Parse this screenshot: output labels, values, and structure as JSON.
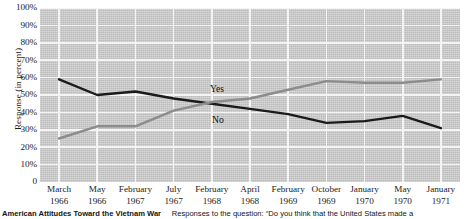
{
  "chart_data": {
    "type": "line",
    "title": "American Attitudes Toward the Vietnam War",
    "xlabel": "",
    "ylabel": "Response (in percent)",
    "ylim": [
      0,
      100
    ],
    "grid": true,
    "legend": "inline-labels",
    "categories": [
      "March 1966",
      "May 1966",
      "February 1967",
      "July 1967",
      "February 1968",
      "April 1968",
      "February 1969",
      "October 1969",
      "January 1970",
      "May 1970",
      "January 1971"
    ],
    "category_months": [
      "March",
      "May",
      "February",
      "July",
      "February",
      "April",
      "February",
      "October",
      "January",
      "May",
      "January"
    ],
    "category_years": [
      "1966",
      "1966",
      "1967",
      "1967",
      "1968",
      "1968",
      "1969",
      "1969",
      "1970",
      "1970",
      "1971"
    ],
    "ytick_labels": [
      "100%",
      "90%",
      "80%",
      "70%",
      "60%",
      "50%",
      "40%",
      "30%",
      "20%",
      "10%",
      "0"
    ],
    "ytick_values": [
      100,
      90,
      80,
      70,
      60,
      50,
      40,
      30,
      20,
      10,
      0
    ],
    "series": [
      {
        "name": "No",
        "label": "No",
        "color": "#1a1a1a",
        "values": [
          59,
          50,
          52,
          48,
          45,
          42,
          39,
          34,
          35,
          38,
          31
        ]
      },
      {
        "name": "Yes",
        "label": "Yes",
        "color": "#8c8c8c",
        "values": [
          25,
          32,
          32,
          41,
          46,
          48,
          53,
          58,
          57,
          57,
          59
        ]
      }
    ]
  },
  "caption": {
    "title": "American Attitudes Toward the Vietnam War",
    "body": "Responses to the question: “Do you think that the United States made a"
  },
  "colors": {
    "plot_background": "#c9c9c9",
    "gridline": "#f4f4f4",
    "series_no": "#1a1a1a",
    "series_yes": "#8c8c8c",
    "text": "#1a1a1a"
  }
}
